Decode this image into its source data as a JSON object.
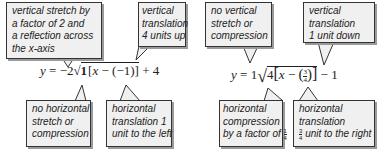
{
  "equation1": {
    "lhs": "y",
    "eq": "=",
    "a": "−2",
    "b": "1",
    "x": "x",
    "minus": "−",
    "h": "(−1)",
    "k": "+ 4",
    "open_bracket": "[",
    "close_bracket": "]"
  },
  "equation2": {
    "lhs": "y",
    "eq": "=",
    "a": "1",
    "b": "4",
    "x": "x",
    "minus": "−",
    "h_num": "3",
    "h_den": "4",
    "k": "− 1",
    "open_bracket": "[",
    "close_bracket": "]"
  },
  "callouts": {
    "vertical_stretch": {
      "lines": [
        "vertical stretch by",
        "a factor of 2 and",
        "a reflection across",
        "the x-axis"
      ]
    },
    "vertical_translation_up": {
      "lines": [
        "vertical",
        "translation",
        "4 units up"
      ]
    },
    "no_horizontal_stretch": {
      "lines": [
        "no horizontal",
        "stretch or",
        "compression"
      ]
    },
    "horizontal_translation_left": {
      "lines": [
        "horizontal",
        "translation 1",
        "unit to the left"
      ]
    },
    "no_vertical_stretch": {
      "lines": [
        "no vertical",
        "stretch or",
        "compression"
      ]
    },
    "vertical_translation_down": {
      "lines": [
        "vertical",
        "translation",
        "1 unit down"
      ]
    },
    "horizontal_compression": {
      "lines": [
        "horizontal",
        "compression",
        "by a factor of"
      ],
      "frac_num": "1",
      "frac_den": "4"
    },
    "horizontal_translation_right": {
      "lines": [
        "horizontal",
        "translation",
        "unit to the right"
      ],
      "frac_num": "3",
      "frac_den": "4"
    }
  }
}
